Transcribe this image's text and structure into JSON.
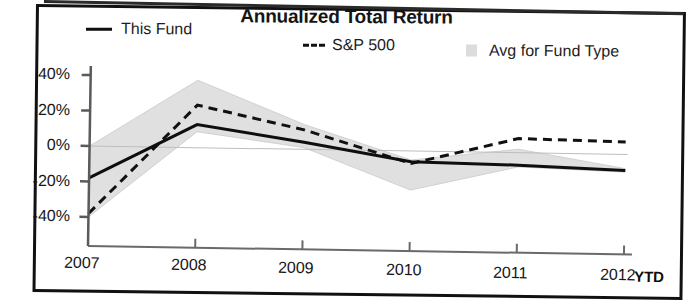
{
  "chart_data": {
    "type": "line",
    "title": "Annualized Total Return",
    "xlabel": "",
    "ylabel": "",
    "x": [
      "2007",
      "2008",
      "2009",
      "2010",
      "2011",
      "2012"
    ],
    "categories": [
      "2007",
      "2008",
      "2009",
      "2010",
      "2011",
      "2012"
    ],
    "xtick_suffix": "YTD",
    "ytick_labels": [
      "40%",
      "20%",
      "0%",
      "-20%",
      "-40%"
    ],
    "ytick_values": [
      40,
      20,
      0,
      -20,
      -40
    ],
    "ylim": [
      -45,
      45
    ],
    "grid": false,
    "legend_position": "top",
    "series": [
      {
        "name": "This Fund",
        "style": "solid",
        "color": "#0e0e0e",
        "values": [
          -18,
          13,
          4,
          -6,
          -7,
          -9
        ]
      },
      {
        "name": "S&P 500",
        "style": "dashed",
        "color": "#111111",
        "values": [
          -38,
          24,
          11,
          -7,
          8,
          7
        ]
      },
      {
        "name": "Avg for Fund Type",
        "style": "band",
        "color": "#dcdcdc",
        "band_upper": [
          0,
          38,
          14,
          -5,
          2,
          -8
        ],
        "band_lower": [
          -40,
          9,
          1,
          -22,
          -8,
          -10
        ]
      }
    ],
    "annotations": []
  },
  "legend": {
    "items": [
      {
        "label": "This Fund",
        "marker": "solid-line-swatch"
      },
      {
        "label": "S&P 500",
        "marker": "dashed-line-swatch"
      },
      {
        "label": "Avg for Fund Type",
        "marker": "shaded-band-swatch"
      }
    ]
  },
  "axes": {
    "y_labels": [
      "40%",
      "20%",
      "0%",
      "-20%",
      "-40%"
    ],
    "x_labels": [
      "2007",
      "2008",
      "2009",
      "2010",
      "2011",
      "2012"
    ],
    "ytd": "YTD"
  }
}
